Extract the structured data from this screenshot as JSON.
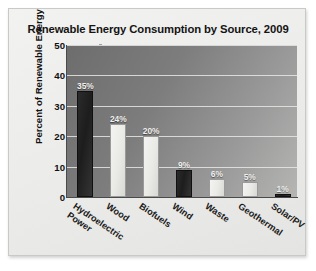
{
  "card": {
    "title": "Renewable Energy Consumption by Source, 2009"
  },
  "chart_data": {
    "type": "bar",
    "title": "Renewable Energy Consumption by Source, 2009",
    "xlabel": "",
    "ylabel": "Percent of Renewable Energy",
    "ylim": [
      0,
      50
    ],
    "yticks": [
      0,
      10,
      20,
      30,
      40,
      50
    ],
    "ytick_labels": [
      "0",
      "10",
      "20",
      "30",
      "40",
      "50"
    ],
    "grid": true,
    "legend": "none",
    "categories": [
      "Hydroelectric Power",
      "Wood",
      "Biofuels",
      "Wind",
      "Waste",
      "Geothermal",
      "Solar/PV"
    ],
    "category_lines": [
      [
        "Hydroelectric",
        "Power"
      ],
      [
        "Wood"
      ],
      [
        "Biofuels"
      ],
      [
        "Wind"
      ],
      [
        "Waste"
      ],
      [
        "Geothermal"
      ],
      [
        "Solar/PV"
      ]
    ],
    "values": [
      35,
      24,
      20,
      9,
      6,
      5,
      1
    ],
    "data_labels": [
      "35%",
      "24%",
      "20%",
      "9%",
      "6%",
      "5%",
      "1%"
    ],
    "bar_styles": [
      "dark",
      "light",
      "light",
      "dark",
      "light",
      "light",
      "dark"
    ],
    "colors": {
      "bar_dark": "#1d1d1d",
      "bar_light": "#eeeeec",
      "plot_background": "#7d7d7d",
      "card_background": "#ebebe9",
      "gridline": "#e8e8e6",
      "axis": "#4a4a4a",
      "title_text": "#141414",
      "label_text": "#111111",
      "value_text": "#f0f0ee"
    }
  }
}
